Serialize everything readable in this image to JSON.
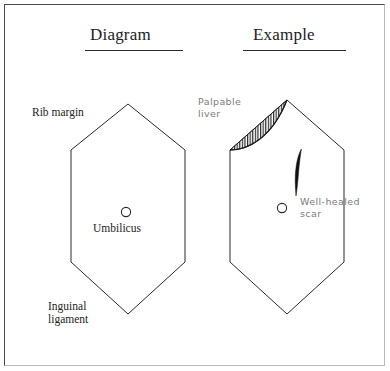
{
  "figure": {
    "type": "medical-illustration",
    "background_color": "#ffffff",
    "frame_color": "#4a4a4a"
  },
  "columns": [
    {
      "id": "diagram",
      "heading": "Diagram",
      "underlined": true
    },
    {
      "id": "example",
      "heading": "Example",
      "underlined": true
    }
  ],
  "headings": {
    "diagram": "Diagram",
    "example": "Example"
  },
  "diagram_panel": {
    "shape": "hexagon-abdomen-outline",
    "outline_color": "#2a2a2a",
    "labels": {
      "rib_margin": "Rib margin",
      "inguinal_ligament_line1": "Inguinal",
      "inguinal_ligament_line2": "ligament",
      "umbilicus": "Umbilicus"
    },
    "umbilicus_marker": "open-circle"
  },
  "example_panel": {
    "shape": "hexagon-abdomen-outline",
    "outline_color": "#2a2a2a",
    "labels": {
      "palpable_liver_line1": "Palpable",
      "palpable_liver_line2": "liver",
      "well_healed_scar_line1": "Well-healed",
      "well_healed_scar_line2": "scar"
    },
    "annotation_color": "#7b7b7b",
    "umbilicus_marker": "open-circle",
    "findings": [
      {
        "name": "palpable-liver",
        "rendering": "hatched-crescent",
        "hatch": "vertical-lines",
        "hatch_color": "#1a1a1a"
      },
      {
        "name": "well-healed-scar",
        "rendering": "dark-sliver",
        "fill_color": "#111111"
      }
    ]
  }
}
